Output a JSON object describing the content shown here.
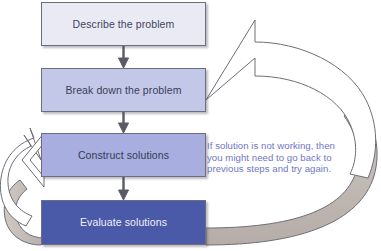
{
  "diagram": {
    "background_color": "#ffffff",
    "steps": [
      {
        "id": "describe",
        "label": "Describe the problem",
        "fill": "#eaeaf5",
        "text_color": "#3f4560"
      },
      {
        "id": "breakdown",
        "label": "Break down the problem",
        "fill": "#c3c8e8",
        "text_color": "#3a4058"
      },
      {
        "id": "construct",
        "label": "Construct solutions",
        "fill": "#a8aee0",
        "text_color": "#353b55"
      },
      {
        "id": "evaluate",
        "label": "Evaluate solutions",
        "fill": "#4a5aa8",
        "text_color": "#eef0fb"
      }
    ],
    "connectors": [
      {
        "id": "describe-to-breakdown",
        "type": "down-arrow",
        "color": "#5a5a66"
      },
      {
        "id": "breakdown-to-construct",
        "type": "down-arrow",
        "color": "#5a5a66"
      },
      {
        "id": "construct-to-evaluate",
        "type": "down-arrow",
        "color": "#5a5a66"
      }
    ],
    "feedback_arrows": [
      {
        "id": "evaluate-to-breakdown",
        "description": "large curved arrow from Evaluate solutions sweeping right and up to Break down the problem",
        "fill": "#ffffff",
        "shade_fill": "#c2bab5",
        "outline": "#6e6e78"
      },
      {
        "id": "evaluate-to-construct",
        "description": "small curved arrow from Evaluate solutions looping left and up to Construct solutions",
        "fill": "#ffffff",
        "shade_fill": "#c2bab5",
        "outline": "#6e6e78"
      }
    ],
    "annotation": {
      "color": "#6f77c4",
      "line1": "If solution is not working, then",
      "line2": "you might need to go back to",
      "line3": "previous steps and try again."
    }
  }
}
